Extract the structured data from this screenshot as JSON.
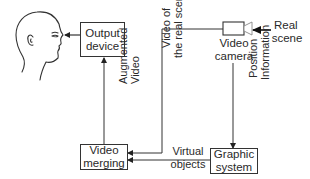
{
  "diagram": {
    "type": "block-diagram",
    "nodes": {
      "viewer": {
        "icon": "human-head-icon"
      },
      "output_device": {
        "line1": "Output",
        "line2": "device"
      },
      "video_camera": {
        "line1": "Video",
        "line2": "camera",
        "icon": "video-camera-icon"
      },
      "real_scene": {
        "line1": "Real",
        "line2": "scene"
      },
      "video_merging": {
        "line1": "Video",
        "line2": "merging"
      },
      "graphic_system": {
        "line1": "Graphic",
        "line2": "system"
      }
    },
    "edges": {
      "augmented_video": {
        "line1": "Augmented",
        "line2": "Video",
        "from": "video_merging",
        "to": "output_device"
      },
      "video_of_real_scenery": {
        "line1": "Video of",
        "line2": "the real scenery",
        "from": "video_camera",
        "to": "video_merging"
      },
      "position_information": {
        "line1": "Position",
        "line2": "Information",
        "from": "video_camera",
        "to": "graphic_system"
      },
      "virtual_objects": {
        "line1": "Virtual",
        "line2": "objects",
        "from": "graphic_system",
        "to": "video_merging"
      },
      "display_to_viewer": {
        "from": "output_device",
        "to": "viewer"
      },
      "scene_to_camera": {
        "from": "real_scene",
        "to": "video_camera"
      }
    },
    "colors": {
      "line": "#333333",
      "background": "#ffffff",
      "text": "#2a2a2a"
    }
  }
}
